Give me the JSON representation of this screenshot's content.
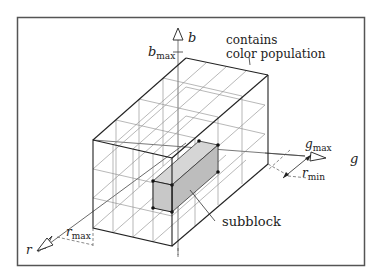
{
  "figure": {
    "frame_color": "#555555",
    "line_color": "#222222",
    "grid_color": "#777777",
    "subblock_fill": "#c8c8c8"
  },
  "axes": {
    "b": {
      "label": "b",
      "max_label": "b",
      "max_sub": "max"
    },
    "g": {
      "label": "g",
      "max_label": "g",
      "max_sub": "max"
    },
    "r": {
      "label": "r",
      "max_label": "r",
      "max_sub": "max",
      "min_label": "r",
      "min_sub": "min"
    }
  },
  "annotations": {
    "population_line1": "contains",
    "population_line2": "color population",
    "subblock": "subblock"
  }
}
